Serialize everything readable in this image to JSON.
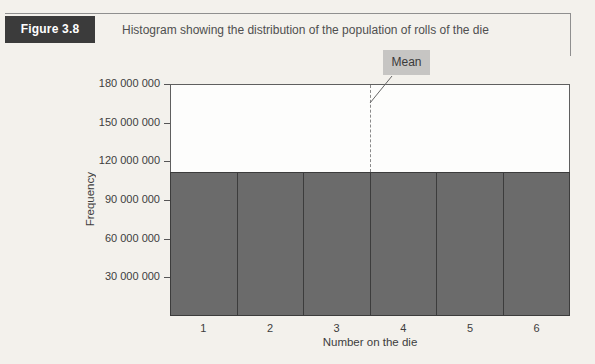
{
  "figure": {
    "label": "Figure 3.8",
    "caption": "Histogram showing the distribution of the population of rolls of the die"
  },
  "chart_data": {
    "type": "bar",
    "title": "Histogram showing the distribution of the population of rolls of the die",
    "categories": [
      "1",
      "2",
      "3",
      "4",
      "5",
      "6"
    ],
    "values": [
      110000000,
      110000000,
      110000000,
      110000000,
      110000000,
      110000000
    ],
    "xlabel": "Number on the die",
    "ylabel": "Frequency",
    "ylim": [
      0,
      180000000
    ],
    "ytick_values": [
      30000000,
      60000000,
      90000000,
      120000000,
      150000000,
      180000000
    ],
    "ytick_labels": [
      "30 000 000",
      "60 000 000",
      "90 000 000",
      "120 000 000",
      "150 000 000",
      "180 000 000"
    ],
    "grid": false,
    "legend": "none",
    "annotations": [
      {
        "label": "Mean",
        "x": 3.5,
        "style": "dashed-vertical-line"
      }
    ]
  },
  "colors": {
    "bar_fill": "#6b6b6b",
    "bar_border": "#3c3c3c",
    "figure_label_bg": "#3b3b3b",
    "figure_label_text": "#ffffff",
    "mean_box_bg": "#c6c5c3",
    "page_bg": "#f3f1ec",
    "plot_bg": "#fdfdfc"
  }
}
